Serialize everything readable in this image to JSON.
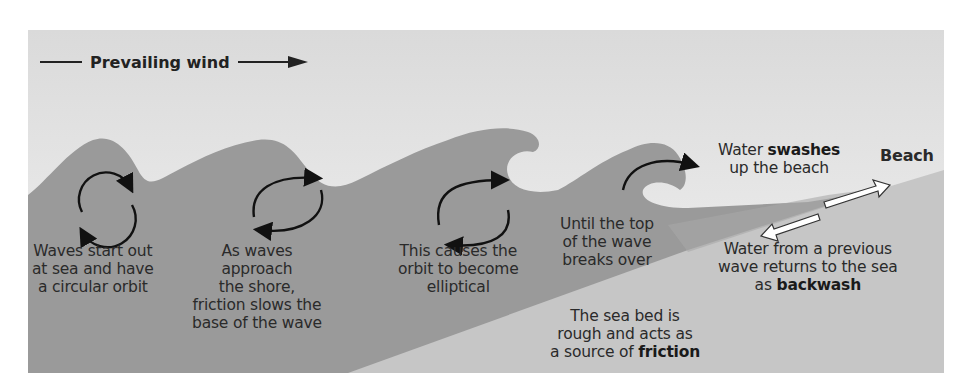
{
  "diagram": {
    "title_arrow_label": "Prevailing wind",
    "beach_label": "Beach",
    "colors": {
      "sky_top": "#dcdcdc",
      "sky_bottom": "#f2f2f2",
      "water": "#9a9a9a",
      "seabed": "#c6c6c6",
      "text": "#2a2a2a",
      "arrows": "#111111"
    },
    "stages": [
      {
        "id": "stage-1",
        "orbit": "circular",
        "lines": [
          "Waves start out",
          "at sea and have",
          "a circular orbit"
        ]
      },
      {
        "id": "stage-2",
        "orbit": "slightly-elliptical",
        "lines": [
          "As waves",
          "approach",
          "the shore,",
          "friction slows the",
          "base of the wave"
        ]
      },
      {
        "id": "stage-3",
        "orbit": "elliptical",
        "lines": [
          "This causes the",
          "orbit to become",
          "elliptical"
        ]
      },
      {
        "id": "stage-4",
        "orbit": "breaking-arc",
        "lines": [
          "Until the top",
          "of the wave",
          "breaks over"
        ]
      }
    ],
    "swash": {
      "pre": "Water ",
      "bold": "swashes",
      "line2": "up the beach"
    },
    "backwash": {
      "line1": "Water from a previous",
      "line2": "wave returns to the sea",
      "pre": "as ",
      "bold": "backwash"
    },
    "seabed": {
      "line1": "The sea bed is",
      "line2": "rough and acts as",
      "pre": "a source of ",
      "bold": "friction"
    }
  }
}
